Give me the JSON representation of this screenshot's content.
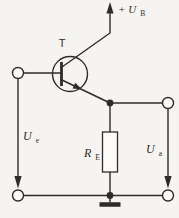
{
  "diagram": {
    "kind": "emitter-follower-transistor-circuit",
    "labels": {
      "transistor": "T",
      "supply": {
        "main": "+ U",
        "sub": "B"
      },
      "input_voltage": {
        "main": "U",
        "sub": "e"
      },
      "output_voltage": {
        "main": "U",
        "sub": "a"
      },
      "emitter_resistor": {
        "main": "R",
        "sub": "E"
      }
    },
    "colors": {
      "paper": "#f6f4f0",
      "line": "#2e2c2a",
      "terminalFill": "#fcfbfa"
    }
  }
}
